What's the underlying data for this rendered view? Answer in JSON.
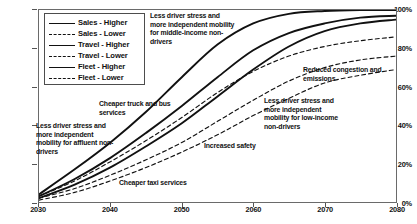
{
  "chart_data": {
    "type": "line",
    "title": "",
    "xlabel": "",
    "ylabel": "",
    "xlim": [
      2030,
      2080
    ],
    "ylim": [
      0,
      100
    ],
    "grid": false,
    "legend_position": "top-left",
    "x_ticks": [
      "2030",
      "2040",
      "2050",
      "2060",
      "2070",
      "2080"
    ],
    "y_ticks": [
      "0%",
      "20%",
      "40%",
      "60%",
      "80%",
      "100%"
    ],
    "x": [
      2030,
      2035,
      2040,
      2045,
      2050,
      2055,
      2060,
      2065,
      2070,
      2075,
      2080
    ],
    "series": [
      {
        "name": "Sales - Higher",
        "style": "solid",
        "values": [
          4,
          17,
          31,
          47,
          65,
          82,
          93,
          98,
          99.5,
          100,
          100
        ]
      },
      {
        "name": "Sales - Lower",
        "style": "dashed",
        "values": [
          3,
          11,
          21,
          32,
          44,
          57,
          68,
          76,
          81,
          84,
          86
        ]
      },
      {
        "name": "Travel - Higher",
        "style": "solid",
        "values": [
          3,
          12,
          23,
          36,
          50,
          65,
          79,
          88,
          93,
          96,
          97
        ]
      },
      {
        "name": "Travel - Lower",
        "style": "dashed",
        "values": [
          2,
          7,
          14,
          22,
          31,
          42,
          53,
          63,
          70,
          74,
          76
        ]
      },
      {
        "name": "Fleet - Higher",
        "style": "solid",
        "values": [
          2,
          9,
          18,
          29,
          41,
          55,
          69,
          81,
          89,
          93,
          95
        ]
      },
      {
        "name": "Fleet - Lower",
        "style": "dashed",
        "values": [
          1,
          5,
          11,
          18,
          26,
          35,
          45,
          54,
          62,
          66,
          69
        ]
      }
    ],
    "annotations": [
      {
        "id": "middle",
        "text": "Less driver stress and more independent mobility for middle-income non-drivers"
      },
      {
        "id": "affluent",
        "text": "Less driver stress and more independent mobility for affluent non-drivers"
      },
      {
        "id": "truckbus",
        "text": "Cheaper truck and bus services"
      },
      {
        "id": "taxi",
        "text": "Cheaper taxi services"
      },
      {
        "id": "safety",
        "text": "Increased safety"
      },
      {
        "id": "lowincome",
        "text": "Less driver stress and more independent mobility for low-income non-drivers"
      },
      {
        "id": "congestion",
        "text": "Reduced congestion and emissions"
      }
    ],
    "colors": {
      "line": "#111111",
      "frame": "#6a6a6a",
      "background": "#ffffff"
    }
  }
}
